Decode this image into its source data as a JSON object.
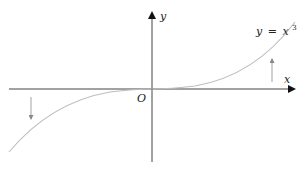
{
  "diagram": {
    "type": "function-graph",
    "function_label": "y = x³",
    "function_label_parts": {
      "lhs": "y",
      "eq": "=",
      "var": "x",
      "exp": "3"
    },
    "axes": {
      "x_label": "x",
      "y_label": "y",
      "origin_label": "O"
    },
    "annotations": [
      {
        "name": "left-arrow",
        "direction": "down"
      },
      {
        "name": "right-arrow",
        "direction": "up"
      }
    ],
    "colors": {
      "axis": "#333333",
      "curve": "#b8b8b8",
      "arrow": "#999999",
      "text": "#222222"
    }
  }
}
